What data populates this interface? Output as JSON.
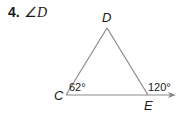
{
  "problem": {
    "number": "4.",
    "prompt": "∠D"
  },
  "diagram": {
    "vertices": {
      "D": "D",
      "C": "C",
      "E": "E"
    },
    "angles": {
      "C_interior": "62°",
      "E_exterior": "120°"
    },
    "line_color": "#8a8a8a"
  }
}
